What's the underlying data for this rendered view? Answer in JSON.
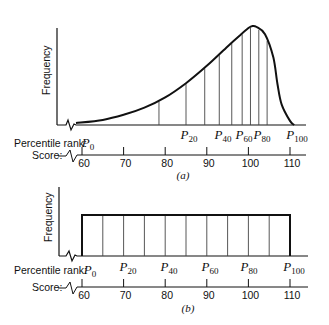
{
  "chart_data": [
    {
      "panel": "a",
      "type": "line",
      "caption": "(a)",
      "ylabel": "Frequency",
      "percentile_row_label": "Percentile rank:",
      "score_row_label": "Score:",
      "percentile_labels": [
        {
          "base": "P",
          "sub": "0",
          "score": 60
        },
        {
          "base": "P",
          "sub": "20",
          "score": 85
        },
        {
          "base": "P",
          "sub": "40",
          "score": 93
        },
        {
          "base": "P",
          "sub": "60",
          "score": 98
        },
        {
          "base": "P",
          "sub": "80",
          "score": 102
        },
        {
          "base": "P",
          "sub": "100",
          "score": 110
        }
      ],
      "score_ticks": [
        60,
        70,
        80,
        90,
        100,
        110
      ],
      "description": "Negatively skewed frequency distribution; vertical lines divide area into 10% slices",
      "decile_scores": [
        78.5,
        85,
        89.5,
        93,
        96,
        98.5,
        100.5,
        102.5,
        104.5
      ],
      "curve": {
        "x": [
          60,
          65,
          70,
          75,
          80,
          85,
          90,
          95,
          98,
          100,
          101,
          102,
          104,
          106,
          107,
          108,
          110,
          111
        ],
        "y": [
          2,
          5,
          10,
          17,
          27,
          41,
          58,
          77,
          88,
          95,
          97,
          96,
          89,
          66,
          40,
          20,
          4,
          0
        ]
      },
      "xlim": [
        56,
        114
      ]
    },
    {
      "panel": "b",
      "type": "area",
      "caption": "(b)",
      "ylabel": "Frequency",
      "percentile_row_label": "Percentile rank:",
      "score_row_label": "Score:",
      "percentile_labels": [
        {
          "base": "P",
          "sub": "0",
          "score": 60
        },
        {
          "base": "P",
          "sub": "20",
          "score": 70
        },
        {
          "base": "P",
          "sub": "40",
          "score": 80
        },
        {
          "base": "P",
          "sub": "60",
          "score": 90
        },
        {
          "base": "P",
          "sub": "80",
          "score": 100
        },
        {
          "base": "P",
          "sub": "100",
          "score": 110
        }
      ],
      "score_ticks": [
        60,
        70,
        80,
        90,
        100,
        110
      ],
      "description": "Rectangular (uniform) distribution from 60 to 110; vertical lines every 5 score points divide area into 10% slices",
      "decile_scores": [
        65,
        70,
        75,
        80,
        85,
        90,
        95,
        100,
        105
      ],
      "uniform": {
        "x_start": 60,
        "x_end": 110,
        "height": 1
      },
      "xlim": [
        56,
        114
      ]
    }
  ]
}
